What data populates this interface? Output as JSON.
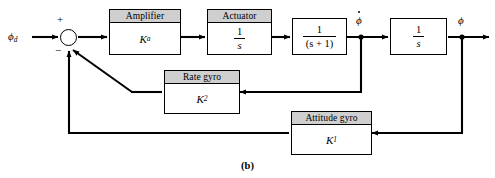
{
  "figure": {
    "caption": "(b)",
    "type": "control-system-block-diagram"
  },
  "signals": {
    "input_label": "ϕ",
    "input_subscript": "d",
    "rate_label": "ϕ",
    "output_label": "ϕ",
    "plus_sign": "+",
    "minus_sign": "−"
  },
  "blocks": [
    {
      "id": "amplifier",
      "header": "Amplifier",
      "body_symbol": "K",
      "body_subscript": "a",
      "has_header": true
    },
    {
      "id": "actuator",
      "header": "Actuator",
      "numerator": "1",
      "denominator": "s",
      "has_header": true
    },
    {
      "id": "plant-lag",
      "header": "",
      "numerator": "1",
      "denominator": "(s + 1)",
      "has_header": false
    },
    {
      "id": "integrator",
      "header": "",
      "numerator": "1",
      "denominator": "s",
      "has_header": false
    },
    {
      "id": "rate-gyro",
      "header": "Rate gyro",
      "body_symbol": "K",
      "body_subscript": "2",
      "has_header": true
    },
    {
      "id": "attitude-gyro",
      "header": "Attitude gyro",
      "body_symbol": "K",
      "body_subscript": "1",
      "has_header": true
    }
  ],
  "colors": {
    "line": "#000000",
    "header_fill": "#cfcfcf",
    "block_fill": "#ffffff",
    "background": "#ffffff"
  }
}
